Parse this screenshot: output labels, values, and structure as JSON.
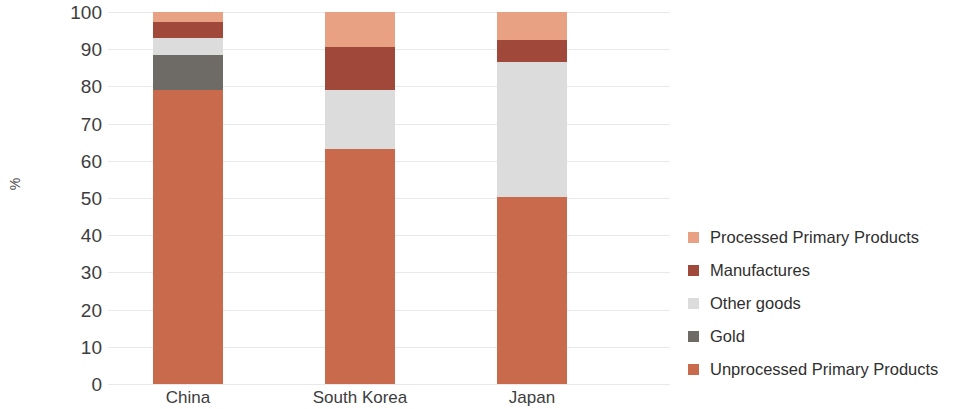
{
  "chart_data": {
    "type": "bar",
    "subtype": "stacked-bar-100",
    "title": "",
    "xlabel": "",
    "ylabel": "%",
    "ylim": [
      0,
      100
    ],
    "yticks": [
      0,
      10,
      20,
      30,
      40,
      50,
      60,
      70,
      80,
      90,
      100
    ],
    "ytick_labels": [
      "0",
      "10",
      "20",
      "30",
      "40",
      "50",
      "60",
      "70",
      "80",
      "90",
      "100"
    ],
    "grid": true,
    "legend_position": "right",
    "categories": [
      "China",
      "South Korea",
      "Japan"
    ],
    "series": [
      {
        "name": "Unprocessed Primary Products",
        "color": "#c96a4c",
        "values": [
          79.0,
          63.2,
          50.3
        ]
      },
      {
        "name": "Gold",
        "color": "#6e6a66",
        "values": [
          9.4,
          0.0,
          0.0
        ]
      },
      {
        "name": "Other goods",
        "color": "#dcdcdc",
        "values": [
          4.6,
          15.8,
          36.2
        ]
      },
      {
        "name": "Manufactures",
        "color": "#a0493b",
        "values": [
          4.3,
          11.5,
          6.0
        ]
      },
      {
        "name": "Processed Primary Products",
        "color": "#e8a183",
        "values": [
          2.7,
          9.5,
          7.5
        ]
      }
    ],
    "legend_order": [
      "Processed Primary Products",
      "Manufactures",
      "Other goods",
      "Gold",
      "Unprocessed Primary Products"
    ],
    "colors": {
      "processed_primary_products": "#e8a183",
      "manufactures": "#a0493b",
      "other_goods": "#dcdcdc",
      "gold": "#6e6a66",
      "unprocessed_primary_products": "#c96a4c",
      "gridline": "#e9e9ec",
      "text": "#3d3d3d",
      "background": "#ffffff"
    }
  }
}
